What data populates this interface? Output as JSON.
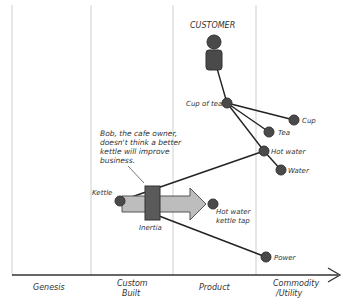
{
  "title": "CUSTOMER",
  "stages": [
    "Genesis",
    "Custom",
    "Built",
    "Product",
    "Commodity",
    "/Utility"
  ],
  "nodes": {
    "cup_of_tea": "Cup of tea",
    "cup": "Cup",
    "tea": "Tea",
    "hot_water": "Hot water",
    "water": "Water",
    "kettle": "Kettle",
    "hot_water_tap_1": "Hot water",
    "hot_water_tap_2": "kettle tap",
    "power": "Power"
  },
  "inertia_label": "Inertia",
  "annotation": [
    "Bob, the cafe owner,",
    "doesn't think a better",
    "kettle will improve",
    "business."
  ],
  "colors": {
    "node": "#4a4a4a",
    "line": "#222222",
    "grid": "#cccccc",
    "arrow": "#bbbbbb",
    "inertia": "#5a5a5a"
  }
}
